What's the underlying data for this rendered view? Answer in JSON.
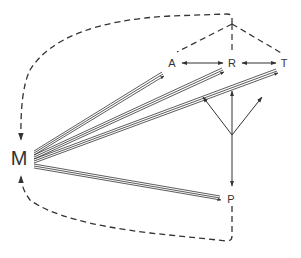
{
  "diagram": {
    "title": "",
    "colors": {
      "ink": "#333333",
      "background": "#ffffff"
    },
    "nodes": [
      {
        "id": "M",
        "label": "M",
        "x": 19,
        "y": 158
      },
      {
        "id": "A",
        "label": "A",
        "x": 172,
        "y": 62
      },
      {
        "id": "R",
        "label": "R",
        "x": 232,
        "y": 62
      },
      {
        "id": "T",
        "label": "T",
        "x": 284,
        "y": 62
      },
      {
        "id": "P",
        "label": "P",
        "x": 231,
        "y": 199
      }
    ],
    "edges": [
      {
        "from": "M",
        "to": "A",
        "style": "triple-line-arrow"
      },
      {
        "from": "M",
        "to": "R",
        "style": "triple-line-arrow"
      },
      {
        "from": "M",
        "to": "T",
        "style": "triple-line-arrow"
      },
      {
        "from": "M",
        "to": "P",
        "style": "triple-line-arrow"
      },
      {
        "from": "R",
        "to": "A",
        "style": "solid-arrow"
      },
      {
        "from": "A",
        "to": "R",
        "style": "solid-arrow"
      },
      {
        "from": "R",
        "to": "T",
        "style": "solid-arrow"
      },
      {
        "from": "T",
        "to": "R",
        "style": "solid-arrow"
      },
      {
        "from": "Y-junction",
        "to": "A-R gap",
        "style": "solid-arrow"
      },
      {
        "from": "Y-junction",
        "to": "R",
        "style": "solid-arrow"
      },
      {
        "from": "Y-junction",
        "to": "R-T gap",
        "style": "solid-arrow"
      },
      {
        "from": "Y-junction",
        "to": "P",
        "style": "solid-arrow"
      },
      {
        "from": "apex",
        "to": "A",
        "style": "dashed"
      },
      {
        "from": "apex",
        "to": "R",
        "style": "dashed"
      },
      {
        "from": "apex",
        "to": "T",
        "style": "dashed"
      },
      {
        "from": "top-corner",
        "to": "M",
        "style": "dashed-curve-arrow"
      },
      {
        "from": "P",
        "to": "M",
        "style": "dashed-curve-arrow"
      }
    ]
  }
}
